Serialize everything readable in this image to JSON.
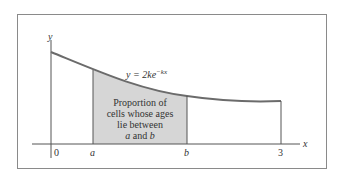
{
  "diagram": {
    "equation": {
      "lhs": "y = 2ke",
      "exponent": "−kx"
    },
    "axes": {
      "x_label": "x",
      "y_label": "y"
    },
    "ticks": {
      "origin": "0",
      "a": "a",
      "b": "b",
      "end": "3"
    },
    "region_label": {
      "line1": "Proportion of",
      "line2": "cells whose ages",
      "line3": "lie between",
      "line4_a": "a",
      "line4_and": " and ",
      "line4_b": "b"
    },
    "colors": {
      "border": "#8a8a8a",
      "curve": "#6b6b6b",
      "shade": "#d6d6d6",
      "axis": "#555555"
    }
  }
}
